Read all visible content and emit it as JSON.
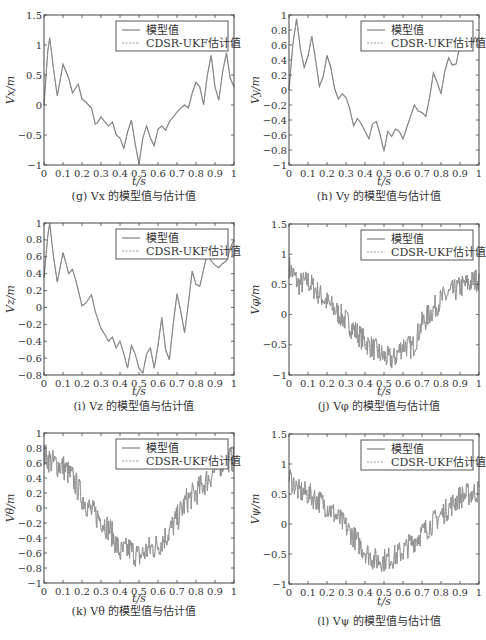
{
  "figure": {
    "legend": {
      "model_label": "模型值",
      "estimate_label": "CDSR-UKF估计值"
    },
    "xlabel": "t/s",
    "colors": {
      "axes": "#444444",
      "model": "#777777",
      "estimate": "#9a9a9a",
      "text": "#333333"
    }
  },
  "panels": [
    {
      "id": "g",
      "caption": "(g) Vx 的模型值与估计值",
      "ylabel": "Vx/m"
    },
    {
      "id": "h",
      "caption": "(h) Vy 的模型值与估计值",
      "ylabel": "Vy/m"
    },
    {
      "id": "i",
      "caption": "(i) Vz 的模型值与估计值",
      "ylabel": "Vz/m"
    },
    {
      "id": "j",
      "caption": "(j) Vφ 的模型值与估计值",
      "ylabel": "Vφ/m"
    },
    {
      "id": "k",
      "caption": "(k) Vθ 的模型值与估计值",
      "ylabel": "Vθ/m"
    },
    {
      "id": "l",
      "caption": "(l) Vψ 的模型值与估计值",
      "ylabel": "Vψ/m"
    }
  ],
  "chart_data": [
    {
      "type": "line",
      "id": "g",
      "title": "(g) Vx 的模型值与估计值",
      "xlabel": "t/s",
      "ylabel": "Vx/m",
      "xlim": [
        0,
        1
      ],
      "ylim": [
        -1,
        1.5
      ],
      "xticks": [
        0,
        0.1,
        0.2,
        0.3,
        0.4,
        0.5,
        0.6,
        0.7,
        0.8,
        0.9,
        1
      ],
      "yticks": [
        -1,
        -0.5,
        0,
        0.5,
        1,
        1.5
      ],
      "legend": [
        "模型值",
        "CDSR-UKF估计值"
      ],
      "legend_position": "upper right",
      "x": [
        0,
        0.02,
        0.03,
        0.05,
        0.07,
        0.1,
        0.13,
        0.15,
        0.18,
        0.2,
        0.22,
        0.25,
        0.27,
        0.28,
        0.3,
        0.32,
        0.34,
        0.36,
        0.38,
        0.4,
        0.42,
        0.44,
        0.46,
        0.48,
        0.5,
        0.52,
        0.54,
        0.56,
        0.58,
        0.6,
        0.62,
        0.64,
        0.66,
        0.68,
        0.7,
        0.72,
        0.74,
        0.76,
        0.78,
        0.8,
        0.82,
        0.84,
        0.86,
        0.88,
        0.9,
        0.92,
        0.94,
        0.96,
        0.98,
        1
      ],
      "series": [
        {
          "name": "模型值",
          "values": [
            0,
            0.9,
            1.12,
            0.6,
            0.15,
            0.68,
            0.45,
            0.2,
            0.35,
            0.1,
            0.05,
            -0.05,
            -0.32,
            -0.3,
            -0.2,
            -0.28,
            -0.35,
            -0.28,
            -0.5,
            -0.55,
            -0.72,
            -0.45,
            -0.25,
            -0.65,
            -0.98,
            -0.55,
            -0.35,
            -0.55,
            -0.68,
            -0.4,
            -0.35,
            -0.42,
            -0.28,
            -0.2,
            -0.12,
            -0.05,
            0,
            -0.05,
            0.2,
            0.38,
            0.3,
            0.0,
            0.5,
            0.83,
            0.3,
            0.08,
            0.55,
            0.87,
            0.45,
            0.3
          ]
        },
        {
          "name": "CDSR-UKF估计值",
          "values": [
            0,
            0.9,
            1.12,
            0.6,
            0.15,
            0.68,
            0.45,
            0.2,
            0.35,
            0.1,
            0.05,
            -0.05,
            -0.32,
            -0.3,
            -0.2,
            -0.28,
            -0.35,
            -0.28,
            -0.5,
            -0.55,
            -0.72,
            -0.45,
            -0.25,
            -0.65,
            -0.98,
            -0.55,
            -0.35,
            -0.55,
            -0.68,
            -0.4,
            -0.35,
            -0.42,
            -0.28,
            -0.2,
            -0.12,
            -0.05,
            0,
            -0.05,
            0.2,
            0.38,
            0.3,
            0.0,
            0.5,
            0.83,
            0.3,
            0.08,
            0.55,
            0.87,
            0.45,
            0.3
          ]
        }
      ]
    },
    {
      "type": "line",
      "id": "h",
      "title": "(h) Vy 的模型值与估计值",
      "xlabel": "t/s",
      "ylabel": "Vy/m",
      "xlim": [
        0,
        1
      ],
      "ylim": [
        -1,
        1
      ],
      "xticks": [
        0,
        0.1,
        0.2,
        0.3,
        0.4,
        0.5,
        0.6,
        0.7,
        0.8,
        0.9,
        1
      ],
      "yticks": [
        -1,
        -0.8,
        -0.6,
        -0.4,
        -0.2,
        0,
        0.2,
        0.4,
        0.6,
        0.8,
        1
      ],
      "legend": [
        "模型值",
        "CDSR-UKF估计值"
      ],
      "legend_position": "upper right",
      "x": [
        0,
        0.02,
        0.04,
        0.06,
        0.08,
        0.1,
        0.12,
        0.14,
        0.16,
        0.18,
        0.2,
        0.22,
        0.24,
        0.26,
        0.28,
        0.3,
        0.32,
        0.34,
        0.36,
        0.38,
        0.4,
        0.42,
        0.44,
        0.46,
        0.48,
        0.5,
        0.52,
        0.54,
        0.56,
        0.58,
        0.6,
        0.62,
        0.64,
        0.66,
        0.68,
        0.7,
        0.72,
        0.74,
        0.76,
        0.78,
        0.8,
        0.82,
        0.84,
        0.86,
        0.88,
        0.9,
        0.92,
        0.94,
        0.96,
        0.98,
        1
      ],
      "series": [
        {
          "name": "模型值",
          "values": [
            0,
            0.6,
            0.95,
            0.55,
            0.3,
            0.45,
            0.72,
            0.4,
            0.05,
            0.18,
            0.46,
            0.3,
            0.02,
            -0.12,
            -0.05,
            -0.1,
            -0.25,
            -0.48,
            -0.38,
            -0.45,
            -0.55,
            -0.65,
            -0.45,
            -0.42,
            -0.6,
            -0.82,
            -0.55,
            -0.62,
            -0.52,
            -0.55,
            -0.65,
            -0.5,
            -0.35,
            -0.2,
            -0.28,
            -0.3,
            -0.35,
            -0.1,
            0.23,
            0.1,
            -0.05,
            0.25,
            0.43,
            0.33,
            0.35,
            0.6,
            0.55,
            0.6,
            0.58,
            0.7,
            0.65
          ]
        },
        {
          "name": "CDSR-UKF估计值",
          "values": [
            0,
            0.6,
            0.95,
            0.55,
            0.3,
            0.45,
            0.72,
            0.4,
            0.05,
            0.18,
            0.46,
            0.3,
            0.02,
            -0.12,
            -0.05,
            -0.1,
            -0.25,
            -0.48,
            -0.38,
            -0.45,
            -0.55,
            -0.65,
            -0.45,
            -0.42,
            -0.6,
            -0.82,
            -0.55,
            -0.62,
            -0.52,
            -0.55,
            -0.65,
            -0.5,
            -0.35,
            -0.2,
            -0.28,
            -0.3,
            -0.35,
            -0.1,
            0.23,
            0.1,
            -0.05,
            0.25,
            0.43,
            0.33,
            0.35,
            0.6,
            0.55,
            0.6,
            0.58,
            0.7,
            0.65
          ]
        }
      ]
    },
    {
      "type": "line",
      "id": "i",
      "title": "(i) Vz 的模型值与估计值",
      "xlabel": "t/s",
      "ylabel": "Vz/m",
      "xlim": [
        0,
        1
      ],
      "ylim": [
        -0.8,
        1
      ],
      "xticks": [
        0,
        0.1,
        0.2,
        0.3,
        0.4,
        0.5,
        0.6,
        0.7,
        0.8,
        0.9,
        1
      ],
      "yticks": [
        -0.8,
        -0.6,
        -0.4,
        -0.2,
        0,
        0.2,
        0.4,
        0.6,
        0.8,
        1
      ],
      "legend": [
        "模型值",
        "CDSR-UKF估计值"
      ],
      "legend_position": "upper right",
      "x": [
        0,
        0.02,
        0.03,
        0.05,
        0.07,
        0.1,
        0.13,
        0.15,
        0.17,
        0.2,
        0.22,
        0.25,
        0.27,
        0.3,
        0.32,
        0.34,
        0.36,
        0.38,
        0.4,
        0.42,
        0.44,
        0.46,
        0.48,
        0.5,
        0.52,
        0.54,
        0.56,
        0.58,
        0.6,
        0.62,
        0.64,
        0.66,
        0.68,
        0.7,
        0.72,
        0.74,
        0.76,
        0.78,
        0.8,
        0.82,
        0.84,
        0.86,
        0.88,
        0.9,
        0.92,
        0.94,
        0.96,
        0.98,
        1
      ],
      "series": [
        {
          "name": "模型值",
          "values": [
            0.35,
            0.85,
            1.0,
            0.6,
            0.3,
            0.65,
            0.4,
            0.45,
            0.3,
            0.02,
            0.05,
            0.15,
            -0.05,
            -0.25,
            -0.32,
            -0.4,
            -0.35,
            -0.48,
            -0.4,
            -0.55,
            -0.72,
            -0.45,
            -0.55,
            -0.72,
            -0.78,
            -0.55,
            -0.48,
            -0.72,
            -0.45,
            -0.12,
            -0.5,
            -0.62,
            -0.2,
            0.16,
            -0.05,
            -0.3,
            0.05,
            0.43,
            0.27,
            0.25,
            0.45,
            0.65,
            0.55,
            0.5,
            0.47,
            0.52,
            0.55,
            0.7,
            0.8
          ]
        },
        {
          "name": "CDSR-UKF估计值",
          "values": [
            0.35,
            0.85,
            1.0,
            0.6,
            0.3,
            0.65,
            0.4,
            0.45,
            0.3,
            0.02,
            0.05,
            0.15,
            -0.05,
            -0.25,
            -0.32,
            -0.4,
            -0.35,
            -0.48,
            -0.4,
            -0.55,
            -0.72,
            -0.45,
            -0.55,
            -0.72,
            -0.78,
            -0.55,
            -0.48,
            -0.72,
            -0.45,
            -0.12,
            -0.5,
            -0.62,
            -0.2,
            0.16,
            -0.05,
            -0.3,
            0.05,
            0.43,
            0.27,
            0.25,
            0.45,
            0.65,
            0.55,
            0.5,
            0.47,
            0.52,
            0.55,
            0.7,
            0.8
          ]
        }
      ]
    },
    {
      "type": "line",
      "id": "j",
      "title": "(j) Vφ 的模型值与估计值",
      "xlabel": "t/s",
      "ylabel": "Vφ/m",
      "xlim": [
        0,
        1
      ],
      "ylim": [
        -1,
        1.5
      ],
      "xticks": [
        0,
        0.1,
        0.2,
        0.3,
        0.4,
        0.5,
        0.6,
        0.7,
        0.8,
        0.9,
        1
      ],
      "yticks": [
        -1,
        -0.5,
        0,
        0.5,
        1,
        1.5
      ],
      "legend": [
        "模型值",
        "CDSR-UKF估计值"
      ],
      "legend_position": "upper right",
      "trend": {
        "x": [
          0,
          0.05,
          0.1,
          0.2,
          0.3,
          0.4,
          0.5,
          0.55,
          0.6,
          0.65,
          0.7,
          0.8,
          0.9,
          1
        ],
        "y": [
          0.8,
          0.5,
          0.55,
          0.2,
          -0.1,
          -0.45,
          -0.7,
          -0.75,
          -0.5,
          -0.55,
          -0.15,
          0.25,
          0.45,
          0.6
        ]
      },
      "noise_amplitude": 0.2
    },
    {
      "type": "line",
      "id": "k",
      "title": "(k) Vθ 的模型值与估计值",
      "xlabel": "t/s",
      "ylabel": "Vθ/m",
      "xlim": [
        0,
        1
      ],
      "ylim": [
        -1,
        1
      ],
      "xticks": [
        0,
        0.1,
        0.2,
        0.3,
        0.4,
        0.5,
        0.6,
        0.7,
        0.8,
        0.9,
        1
      ],
      "yticks": [
        -1,
        -0.8,
        -0.6,
        -0.4,
        -0.2,
        0,
        0.2,
        0.4,
        0.6,
        0.8,
        1
      ],
      "legend": [
        "模型值",
        "CDSR-UKF估计值"
      ],
      "legend_position": "upper right",
      "trend": {
        "x": [
          0,
          0.05,
          0.1,
          0.15,
          0.2,
          0.25,
          0.3,
          0.35,
          0.4,
          0.45,
          0.5,
          0.55,
          0.6,
          0.65,
          0.7,
          0.75,
          0.8,
          0.85,
          0.9,
          0.95,
          1
        ],
        "y": [
          0.7,
          0.6,
          0.55,
          0.4,
          0.15,
          -0.05,
          -0.15,
          -0.3,
          -0.6,
          -0.55,
          -0.65,
          -0.55,
          -0.5,
          -0.35,
          -0.15,
          0.1,
          0.2,
          0.35,
          0.5,
          0.65,
          0.65
        ]
      },
      "noise_amplitude": 0.18
    },
    {
      "type": "line",
      "id": "l",
      "title": "(l) Vψ 的模型值与估计值",
      "xlabel": "t/s",
      "ylabel": "Vψ/m",
      "xlim": [
        0,
        1
      ],
      "ylim": [
        -1,
        1.5
      ],
      "xticks": [
        0,
        0.1,
        0.2,
        0.3,
        0.4,
        0.5,
        0.6,
        0.7,
        0.8,
        0.9,
        1
      ],
      "yticks": [
        -1,
        -0.5,
        0,
        0.5,
        1,
        1.5
      ],
      "legend": [
        "模型值",
        "CDSR-UKF估计值"
      ],
      "legend_position": "upper right",
      "trend": {
        "x": [
          0,
          0.05,
          0.1,
          0.2,
          0.3,
          0.4,
          0.45,
          0.5,
          0.55,
          0.6,
          0.7,
          0.8,
          0.9,
          1
        ],
        "y": [
          0.8,
          0.55,
          0.5,
          0.3,
          -0.05,
          -0.45,
          -0.6,
          -0.6,
          -0.55,
          -0.45,
          -0.15,
          0.15,
          0.45,
          0.55
        ]
      },
      "noise_amplitude": 0.2
    }
  ]
}
